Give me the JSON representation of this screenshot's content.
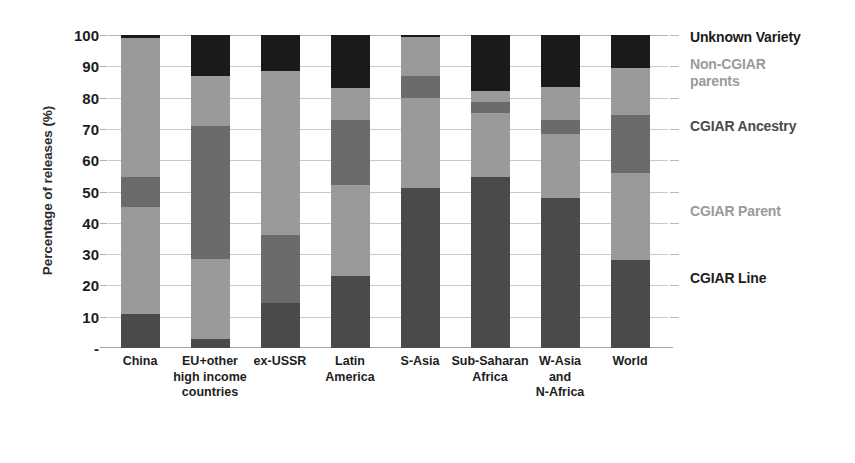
{
  "chart_data": {
    "type": "bar",
    "subtype": "stacked-bar-100",
    "title": "",
    "xlabel": "",
    "ylabel": "Percentage of releases (%)",
    "ylim": [
      0,
      100
    ],
    "yticks": [
      10,
      20,
      30,
      40,
      50,
      60,
      70,
      80,
      90,
      100
    ],
    "ytick_labels": [
      "10",
      "20",
      "30",
      "40",
      "50",
      "60",
      "70",
      "80",
      "90",
      "100"
    ],
    "grid": true,
    "legend_position": "right",
    "categories": [
      "China",
      "EU+other high income countries",
      "ex-USSR",
      "Latin America",
      "S-Asia",
      "Sub-Saharan Africa",
      "W-Asia and N-Africa",
      "World"
    ],
    "category_label_lines": [
      [
        "China"
      ],
      [
        "EU+other",
        "high income",
        "countries"
      ],
      [
        "ex-USSR"
      ],
      [
        "Latin",
        "America"
      ],
      [
        "S-Asia"
      ],
      [
        "Sub-Saharan",
        "Africa"
      ],
      [
        "W-Asia",
        "and",
        "N-Africa"
      ],
      [
        "World"
      ]
    ],
    "series": [
      {
        "name": "CGIAR Line",
        "color": "#4a4a4a",
        "values": [
          11.0,
          3.0,
          14.5,
          23.0,
          51.0,
          54.5,
          48.0,
          28.0
        ]
      },
      {
        "name": "CGIAR Parent",
        "color": "#9a9a9a",
        "values": [
          34.0,
          25.5,
          0.0,
          29.0,
          29.0,
          20.5,
          20.5,
          28.0
        ]
      },
      {
        "name": "CGIAR Ancestry",
        "color": "#6b6b6b",
        "values": [
          9.5,
          42.5,
          21.5,
          21.0,
          7.0,
          3.5,
          4.5,
          18.5
        ]
      },
      {
        "name": "Non-CGIAR parents",
        "color": "#9a9a9a",
        "values": [
          44.5,
          16.0,
          52.5,
          10.0,
          12.5,
          3.5,
          10.5,
          15.0
        ]
      },
      {
        "name": "Unknown Variety",
        "color": "#1a1a1a",
        "values": [
          1.0,
          13.0,
          11.5,
          17.0,
          0.5,
          18.0,
          16.5,
          10.5
        ]
      }
    ],
    "legend": [
      {
        "label": "Unknown Variety",
        "color": "#1a1a1a",
        "y_pct": 99.0
      },
      {
        "label": "Non-CGIAR\nparents",
        "color": "#9a9a9a",
        "y_pct": 90.5
      },
      {
        "label": "CGIAR Ancestry",
        "color": "#4a4a4a",
        "y_pct": 70.5
      },
      {
        "label": "CGIAR Parent",
        "color": "#9a9a9a",
        "y_pct": 43.5
      },
      {
        "label": "CGIAR Line",
        "color": "#1d1d1d",
        "y_pct": 22.0
      }
    ],
    "colors": {
      "cgiar_line": "#4a4a4a",
      "cgiar_parent": "#9a9a9a",
      "cgiar_ancestry": "#6b6b6b",
      "non_cgiar_parents": "#9a9a9a",
      "unknown_variety": "#1a1a1a",
      "gridline": "#c9c9c9",
      "axis_text": "#1d1d1d",
      "background": "#ffffff"
    }
  }
}
